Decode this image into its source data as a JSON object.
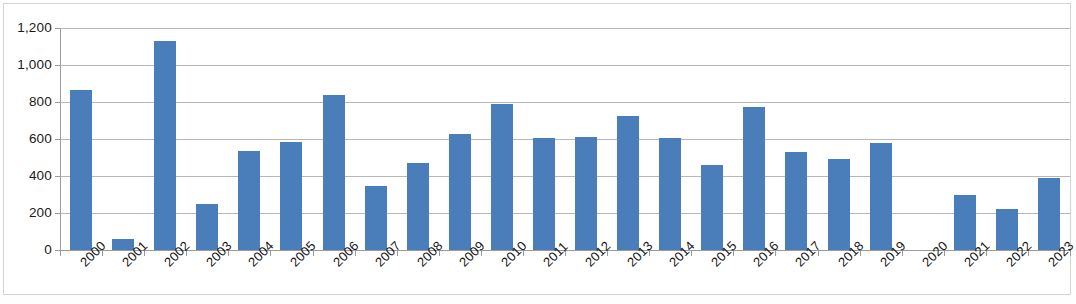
{
  "chart_data": {
    "type": "bar",
    "title": "",
    "subtitle": "",
    "xlabel": "",
    "ylabel": "",
    "ylim": [
      0,
      1200
    ],
    "ytick_values": [
      0,
      200,
      400,
      600,
      800,
      1000,
      1200
    ],
    "ytick_labels": [
      "0",
      "200",
      "400",
      "600",
      "800",
      "1,000",
      "1,200"
    ],
    "grid": true,
    "legend": false,
    "legend_position": "none",
    "bar_color": "#4a7ebb",
    "gridline_color": "#b7b7b7",
    "axis_color": "#9a9a9a",
    "categories": [
      "2000",
      "2001",
      "2002",
      "2003",
      "2004",
      "2005",
      "2006",
      "2007",
      "2008",
      "2009",
      "2010",
      "2011",
      "2012",
      "2013",
      "2014",
      "2015",
      "2016",
      "2017",
      "2018",
      "2019",
      "2020",
      "2021",
      "2022",
      "2023"
    ],
    "values": [
      865,
      62,
      1131,
      248,
      533,
      586,
      840,
      348,
      468,
      629,
      791,
      605,
      611,
      727,
      605,
      460,
      772,
      531,
      494,
      580,
      0,
      295,
      223,
      389
    ]
  }
}
